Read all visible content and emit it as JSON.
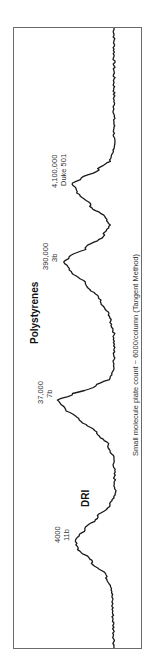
{
  "chart_data": {
    "type": "line",
    "orientation": "rotated-90-ccw",
    "title": "Polystyrenes",
    "detector_label": "DRI",
    "caption": "Small molecule plate count ~ 6000/column (Tangent Method)",
    "xlabel": "",
    "ylabel": "",
    "grid": false,
    "legend": null,
    "peaks": [
      {
        "mw": "4,100,000",
        "name": "Duke 501",
        "relative_height": 0.48
      },
      {
        "mw": "390,000",
        "name": "3b",
        "relative_height": 0.58
      },
      {
        "mw": "37,000",
        "name": "7b",
        "relative_height": 0.66
      },
      {
        "mw": "4000",
        "name": "11b",
        "relative_height": 0.45
      }
    ],
    "series": [
      {
        "name": "DRI",
        "points_image_xy": [
          [
            114,
            28
          ],
          [
            114,
            150
          ],
          [
            110,
            160
          ],
          [
            98,
            170
          ],
          [
            82,
            178
          ],
          [
            73,
            183
          ],
          [
            76,
            190
          ],
          [
            90,
            205
          ],
          [
            106,
            218
          ],
          [
            110,
            225
          ],
          [
            104,
            235
          ],
          [
            86,
            248
          ],
          [
            70,
            257
          ],
          [
            64,
            262
          ],
          [
            70,
            270
          ],
          [
            86,
            285
          ],
          [
            100,
            300
          ],
          [
            110,
            318
          ],
          [
            114,
            335
          ],
          [
            114,
            370
          ],
          [
            110,
            378
          ],
          [
            96,
            386
          ],
          [
            72,
            395
          ],
          [
            58,
            400
          ],
          [
            64,
            408
          ],
          [
            80,
            420
          ],
          [
            96,
            432
          ],
          [
            108,
            445
          ],
          [
            114,
            460
          ],
          [
            115,
            495
          ],
          [
            110,
            505
          ],
          [
            98,
            517
          ],
          [
            84,
            530
          ],
          [
            75,
            540
          ],
          [
            78,
            548
          ],
          [
            92,
            562
          ],
          [
            106,
            575
          ],
          [
            112,
            590
          ],
          [
            114,
            648
          ]
        ]
      }
    ]
  },
  "annotations": {
    "peak1_mw": "4,100,000",
    "peak1_name": "Duke 501",
    "peak2_mw": "390,000",
    "peak2_name": "3b",
    "peak3_mw": "37,000",
    "peak3_name": "7b",
    "peak4_mw": "4000",
    "peak4_name": "11b",
    "title": "Polystyrenes",
    "detector": "DRI",
    "caption": "Small molecule plate count ~ 6000/column (Tangent Method)"
  },
  "colors": {
    "trace": "#1a1a1a",
    "frame": "#6a6a6a",
    "text": "#333333",
    "background": "#ffffff"
  }
}
